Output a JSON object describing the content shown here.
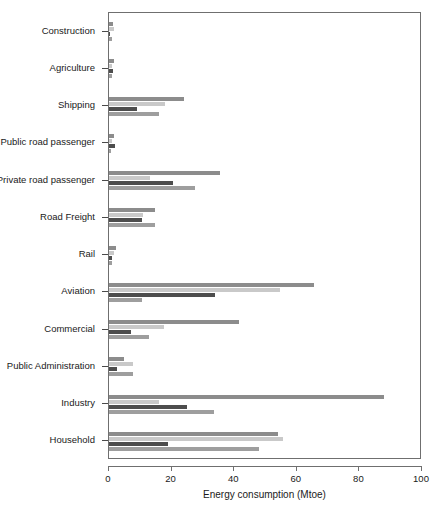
{
  "chart_data": {
    "type": "bar",
    "orientation": "horizontal",
    "title": "",
    "xlabel": "Energy consumption (Mtoe)",
    "ylabel": "",
    "xlim": [
      0,
      100
    ],
    "xticks": [
      0,
      20,
      40,
      60,
      80,
      100
    ],
    "grid": false,
    "legend": "none",
    "categories": [
      "Construction",
      "Agriculture",
      "Shipping",
      "Public road passenger",
      "Private road passenger",
      "Road Freight",
      "Rail",
      "Aviation",
      "Commercial",
      "Public Administration",
      "Industry",
      "Household"
    ],
    "series": [
      {
        "name": "series-1",
        "color": "#8c8c8c",
        "values": [
          1.2,
          1.6,
          24.0,
          1.5,
          35.5,
          14.8,
          2.2,
          65.5,
          41.5,
          4.8,
          88.0,
          54.0
        ]
      },
      {
        "name": "series-2",
        "color": "#c9c9c9",
        "values": [
          1.6,
          1.1,
          18.0,
          1.0,
          13.2,
          11.0,
          1.5,
          54.5,
          17.5,
          7.8,
          16.0,
          55.5
        ]
      },
      {
        "name": "series-3",
        "color": "#4d4d4d",
        "values": [
          0.3,
          1.4,
          9.0,
          1.9,
          20.6,
          10.5,
          1.1,
          34.0,
          7.0,
          2.6,
          25.0,
          19.0
        ]
      },
      {
        "name": "series-4",
        "color": "#9e9e9e",
        "values": [
          0.9,
          1.0,
          16.0,
          0.7,
          27.5,
          14.8,
          0.9,
          10.5,
          12.8,
          7.6,
          33.5,
          48.0
        ]
      }
    ]
  }
}
